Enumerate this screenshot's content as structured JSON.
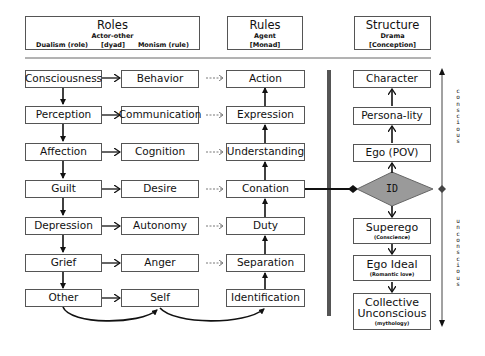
{
  "headers": {
    "roles": {
      "title": "Roles",
      "subtitle": "Actor-other",
      "left": "Dualism (role)",
      "middle": "[dyad]",
      "right": "Monism (rule)"
    },
    "rules": {
      "title": "Rules",
      "line1": "Agent",
      "line2": "[Monad]"
    },
    "structure": {
      "title": "Structure",
      "line1": "Drama",
      "line2": "[Conception]"
    }
  },
  "dualism_column": [
    "Consciousness",
    "Perception",
    "Affection",
    "Guilt",
    "Depression",
    "Grief",
    "Other"
  ],
  "monism_column": [
    "Behavior",
    "Communication",
    "Cognition",
    "Desire",
    "Autonomy",
    "Anger",
    "Self"
  ],
  "rules_column": [
    "Action",
    "Expression",
    "Understanding",
    "Conation",
    "Duty",
    "Separation",
    "Identification"
  ],
  "structure_column": {
    "upper": [
      "Character",
      "Persona-lity",
      "Ego (POV)"
    ],
    "center": "ID",
    "lower": [
      {
        "label": "Superego",
        "sub": "(Conscience)"
      },
      {
        "label": "Ego Ideal",
        "sub": "(Romantic love)"
      },
      {
        "label": "Collective Unconscious",
        "sub": "(mythology)"
      }
    ]
  },
  "axis_labels": {
    "upper": "conscious",
    "lower": "unconscious"
  },
  "colors": {
    "diamond": "#9a9a9a",
    "separator": "#555555",
    "line": "#111111"
  }
}
